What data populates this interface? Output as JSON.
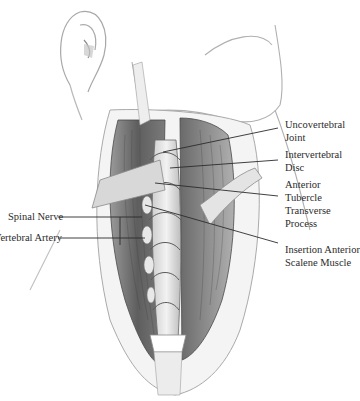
{
  "figure": {
    "labels_right": [
      {
        "id": "uncovertebral-joint",
        "lines": [
          "Uncovertebral",
          "Joint"
        ]
      },
      {
        "id": "intervertebral-disc",
        "lines": [
          "Intervertebral",
          "Disc"
        ]
      },
      {
        "id": "anterior-tubercle-transverse-process",
        "lines": [
          "Anterior",
          "Tubercle",
          "Transverse",
          "Process"
        ]
      },
      {
        "id": "insertion-anterior-scalene-muscle",
        "lines": [
          "Insertion Anterior",
          "Scalene Muscle"
        ]
      }
    ],
    "labels_left": [
      {
        "id": "spinal-nerve",
        "lines": [
          "Spinal Nerve"
        ]
      },
      {
        "id": "vertebral-artery",
        "lines": [
          "Vertebral Artery"
        ]
      }
    ],
    "colors": {
      "ink": "#2b2b2b",
      "muscle_dark": "#5a5a5a",
      "muscle_mid": "#8a8a8a",
      "retractor": "#d9d9d9",
      "skin_line": "#9a9a9a"
    }
  }
}
